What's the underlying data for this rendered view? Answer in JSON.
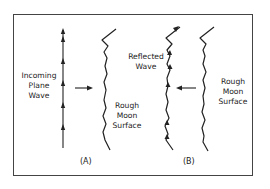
{
  "figure": {
    "panels": [
      {
        "id": "A",
        "label": "(A)",
        "wave_label": [
          "Incoming",
          "Plane",
          "Wave"
        ],
        "surface_label": [
          "Rough",
          "Moon",
          "Surface"
        ]
      },
      {
        "id": "B",
        "label": "(B)",
        "wave_label": [
          "Reflected",
          "Wave"
        ],
        "surface_label": [
          "Rough",
          "Moon",
          "Surface"
        ]
      }
    ],
    "colors": {
      "line": "#222222",
      "border": "#444444",
      "background": "#ffffff"
    }
  }
}
